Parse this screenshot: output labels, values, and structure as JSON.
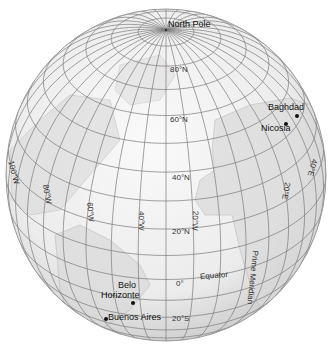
{
  "map": {
    "type": "orthographic-globe",
    "center": {
      "lat": 29,
      "lon": -30
    },
    "graticule_step_deg": 10,
    "colors": {
      "ocean": "#f2f2f2",
      "land": "#d6d6d6",
      "grid": "#7a7a7a",
      "rim": "#9a9a9a"
    }
  },
  "labels": {
    "north_pole": "North Pole",
    "lat_80n": "80°N",
    "lat_60n": "60°N",
    "lat_40n": "40°N",
    "lat_20n": "20°N",
    "lat_0": "0°",
    "lat_20s": "20°S",
    "lon_100w": "100°W",
    "lon_80w": "80°W",
    "lon_60w": "60°W",
    "lon_40w": "40°W",
    "lon_20w": "20°W",
    "lon_20e": "20°E",
    "lon_40e": "40°E",
    "equator": "Equator",
    "prime_meridian": "Prime Meridian"
  },
  "cities": [
    {
      "name": "Baghdad",
      "x": 296,
      "y": 115,
      "lx": 268,
      "ly": 102
    },
    {
      "name": "Nicosia",
      "x": 285,
      "y": 123,
      "lx": 261,
      "ly": 125
    },
    {
      "name": "Belo Horizonte",
      "x": 132,
      "y": 302,
      "lx": 118,
      "ly": 283
    },
    {
      "name": "Buenos Aires",
      "x": 105,
      "y": 318,
      "lx": 108,
      "ly": 314
    }
  ]
}
